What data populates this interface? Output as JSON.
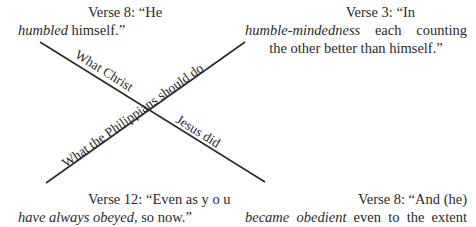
{
  "verses": {
    "top_left": {
      "line1": "Verse 8: “He",
      "emph": "humbled",
      "rest": " himself.”"
    },
    "top_right": {
      "line1": "Verse 3: “In",
      "emph": "humble-mindedness",
      "rest": " each counting",
      "line3": "the other better than himself.”"
    },
    "bottom_left": {
      "line1": "Verse 12: “Even as y o u",
      "emph": "have always obeyed,",
      "rest": " so now.”"
    },
    "bottom_right": {
      "line1": "Verse 8: “And  (he)",
      "emph": "became obedient",
      "rest": " even to the extent",
      "line3": "of death, yes death by a cross.”"
    }
  },
  "axes": {
    "christ_line_upper": "What Christ",
    "christ_line_lower": "Jesus did",
    "philippians_line": "What the Philippians should do"
  },
  "colors": {
    "ink": "#2a2a2a",
    "background": "#ffffff"
  }
}
